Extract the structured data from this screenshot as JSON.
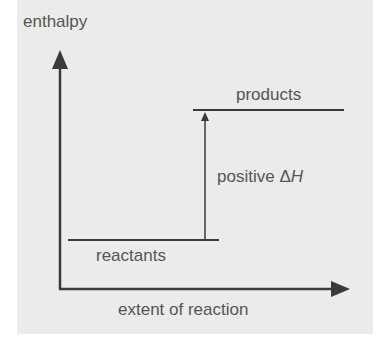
{
  "diagram": {
    "type": "energy-level-diagram",
    "y_axis_label": "enthalpy",
    "x_axis_label": "extent of reaction",
    "levels": [
      {
        "name": "reactants",
        "label": "reactants",
        "relative_level": "low"
      },
      {
        "name": "products",
        "label": "products",
        "relative_level": "high"
      }
    ],
    "arrow": {
      "from": "reactants",
      "to": "products",
      "label_prefix": "positive ",
      "label_delta": "Δ",
      "label_symbol": "H"
    },
    "colors": {
      "background": "#ebebeb",
      "line": "#3a3a3a",
      "text": "#555555"
    }
  }
}
